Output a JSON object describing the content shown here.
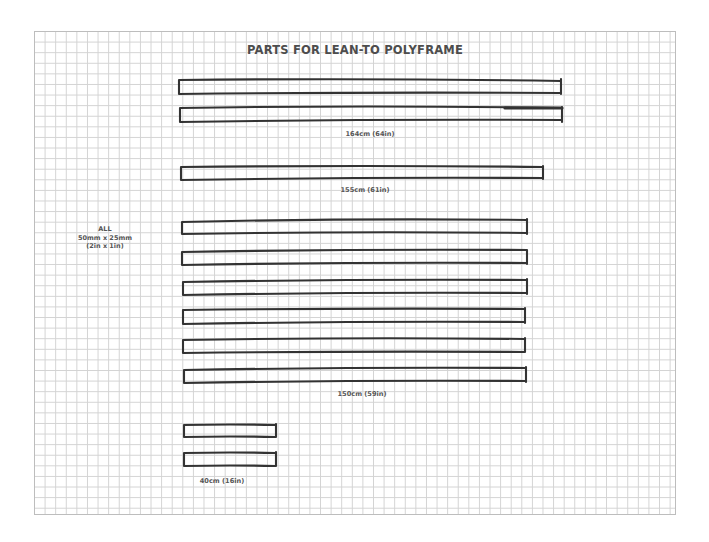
{
  "title": "PARTS FOR LEAN-TO POLYFRAME",
  "material_spec": {
    "line1": "ALL",
    "line2": "50mm x 25mm",
    "line3": "(2in x 1in)"
  },
  "groups": [
    {
      "id": "164",
      "label": "164cm (64in)",
      "quantity": 2
    },
    {
      "id": "155",
      "label": "155cm (61in)",
      "quantity": 1
    },
    {
      "id": "150",
      "label": "150cm (59in)",
      "quantity": 6
    },
    {
      "id": "40",
      "label": "40cm (16in)",
      "quantity": 2
    }
  ],
  "colors": {
    "grid_line": "#d3d3d3",
    "stroke": "#333333",
    "text": "#555555"
  }
}
